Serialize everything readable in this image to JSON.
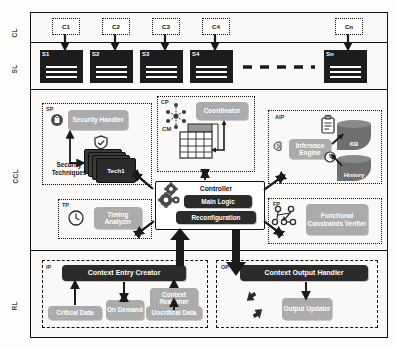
{
  "diagram": {
    "layers": [
      {
        "id": "CL",
        "label": "CL",
        "name": "client-layer"
      },
      {
        "id": "SL",
        "label": "SL",
        "name": "server-layer"
      },
      {
        "id": "CCL",
        "label": "CCL",
        "name": "context-control-layer"
      },
      {
        "id": "RL",
        "label": "RL",
        "name": "resource-layer"
      }
    ],
    "colors": {
      "gray_node": "#ababab",
      "dark_node": "#2b2b2b",
      "server_fill": "#1c1c1c",
      "db_fill": "#6f6f6f",
      "frame": "#111111",
      "background": "#fdfdfc"
    }
  },
  "client_layer": {
    "clients": [
      {
        "label": "C1"
      },
      {
        "label": "C2"
      },
      {
        "label": "C3"
      },
      {
        "label": "C4"
      },
      {
        "label": "Cn"
      }
    ]
  },
  "server_layer": {
    "servers": [
      {
        "label": "S1"
      },
      {
        "label": "S2"
      },
      {
        "label": "S3"
      },
      {
        "label": "S4"
      },
      {
        "label": "Sn"
      }
    ],
    "ellipsis": "- - - - -"
  },
  "ccl": {
    "partitions": [
      {
        "tag": "SP",
        "name": "security-partition"
      },
      {
        "tag": "CP",
        "name": "coordination-partition"
      },
      {
        "tag": "AIP",
        "name": "artificial-intelligence-partition"
      },
      {
        "tag": "TP",
        "name": "timing-partition"
      },
      {
        "tag": "FP",
        "name": "functional-partition"
      }
    ],
    "sp": {
      "tag": "SP",
      "handler": "Security Handler",
      "techniques_label": "Security Techniques",
      "tech_card": "Tech1",
      "lock_icon": "lock-icon",
      "shield_icon": "shield-icon"
    },
    "cp": {
      "tag": "CP",
      "coordinator": "Coordinator",
      "cm_label": "CM",
      "network_icon": "network-nodes-icon",
      "matrix_icon": "matrix-grid-icon"
    },
    "aip": {
      "tag": "AIP",
      "inference_engine": "Inference Engine",
      "kb": "KB",
      "history": "History",
      "brain_icon": "brain-icon",
      "clipboard_icon": "clipboard-icon",
      "clock_small_icon": "clock-icon"
    },
    "tp": {
      "tag": "TP",
      "analyzer": "Timing Analyzer",
      "clock_icon": "clock-icon"
    },
    "fp": {
      "tag": "FP",
      "verifier": "Functional Constraints Verifier",
      "graph_icon": "node-graph-icon"
    },
    "controller": {
      "title": "Controller",
      "main_logic": "Main Logic",
      "reconfiguration": "Reconfiguration",
      "gears_icon": "gears-icon"
    }
  },
  "rl": {
    "ip": {
      "tag": "IP",
      "entry_creator": "Context Entry Creator",
      "critical_data": "Critical Data",
      "on_demand": "On Demand",
      "context_reasoner": "Context Reasoner",
      "uncritical_data": "Uncritical Data"
    },
    "op": {
      "tag": "OP",
      "output_handler": "Context Output Handler",
      "output_updater": "Output Updater",
      "sync_icon": "sync-arrows-icon"
    }
  }
}
